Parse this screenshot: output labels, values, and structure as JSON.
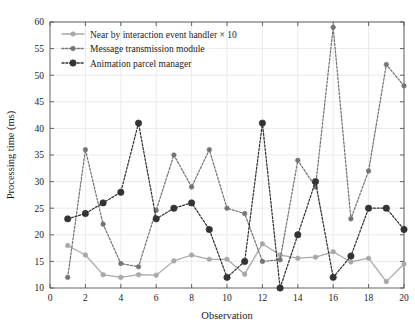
{
  "chart_data": {
    "type": "line",
    "title": "",
    "xlabel": "Observation",
    "ylabel": "Processing time (ms)",
    "x": [
      1,
      2,
      3,
      4,
      5,
      6,
      7,
      8,
      9,
      10,
      11,
      12,
      13,
      14,
      15,
      16,
      17,
      18,
      19,
      20
    ],
    "xlim": [
      0,
      20
    ],
    "ylim": [
      10,
      60
    ],
    "xticks": [
      0,
      2,
      4,
      6,
      8,
      10,
      12,
      14,
      16,
      18,
      20
    ],
    "xtick_labels": [
      "0",
      "2",
      "4",
      "6",
      "8",
      "10",
      "12",
      "14",
      "16",
      "18",
      "20"
    ],
    "yticks": [
      10,
      15,
      20,
      25,
      30,
      35,
      40,
      45,
      50,
      55,
      60
    ],
    "ytick_labels": [
      "10",
      "15",
      "20",
      "25",
      "30",
      "35",
      "40",
      "45",
      "50",
      "55",
      "60"
    ],
    "grid": true,
    "legend_position": "top-left",
    "series": [
      {
        "name": "Near by interaction event handler × 10",
        "color": "#a8a8a8",
        "marker": "circle-filled",
        "linestyle": "solid",
        "values": [
          18,
          16.2,
          12.5,
          12,
          12.5,
          12.4,
          15.1,
          16.2,
          15.4,
          15.4,
          12.6,
          18.3,
          16.2,
          15.6,
          15.8,
          16.8,
          14.9,
          15.6,
          11.2,
          14.5
        ]
      },
      {
        "name": "Message transmission module",
        "color": "#757575",
        "marker": "circle-filled",
        "linestyle": "dotted",
        "values": [
          12,
          36,
          22,
          14.6,
          14,
          24.6,
          35,
          29,
          36,
          25,
          24,
          15,
          15.3,
          34,
          29,
          59,
          23,
          32,
          52,
          48
        ]
      },
      {
        "name": "Animation parcel manager",
        "color": "#333333",
        "marker": "circle-large",
        "linestyle": "dotted",
        "values": [
          23,
          24,
          26,
          28,
          41,
          23,
          25,
          26,
          21,
          12,
          15,
          41,
          10,
          20,
          30,
          12,
          16,
          25,
          25,
          21
        ]
      }
    ]
  }
}
